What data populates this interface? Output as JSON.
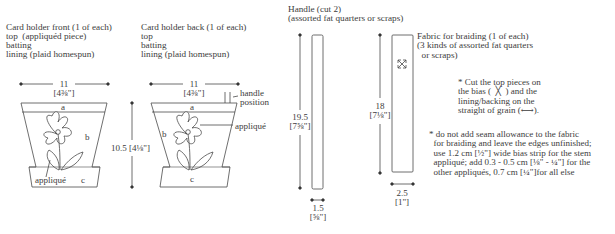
{
  "front": {
    "title": "Card holder front (1 of each)",
    "lines": [
      "top  (appliquéd piece)",
      "batting",
      "lining (plaid homespun)"
    ],
    "width_cm": "11",
    "width_in": "[4⅜\"]",
    "height_label": "10.5 [4⅛\"]",
    "section_a": "a",
    "section_b": "b",
    "section_c": "c",
    "applique_label": "appliqué"
  },
  "back": {
    "title": "Card holder back (1 of each)",
    "lines": [
      "top",
      "batting",
      "lining (plaid homespun)"
    ],
    "width_cm": "11",
    "width_in": "[4⅜\"]",
    "section_a": "a",
    "section_b": "b",
    "section_c": "c",
    "handle_position_label": "handle\nposition",
    "applique_label": "appliqué"
  },
  "handle": {
    "title": "Handle (cut 2)",
    "subtitle": "(assorted fat quarters or scraps)",
    "length_cm": "19.5",
    "length_in": "[7⅝\"]",
    "width_cm": "1.5",
    "width_in": "[⅝\"]"
  },
  "braiding": {
    "title": "Fabric for braiding (1 of each)",
    "subtitle": "(3 kinds of assorted fat quarters\n  or scraps)",
    "length_cm": "18",
    "length_in": "[7⅛\"]",
    "width_cm": "2.5",
    "width_in": "[1\"]"
  },
  "notes": {
    "bias_note": "* Cut the top pieces on\nthe bias (  ╳  ) and the\nlining/backing on the\nstraight of grain (⟷).",
    "seam_note": "* do not add seam allowance to the fabric\n  for braiding and leave the edges unfinished;\n  use 1.2 cm [½\"] wide bias strip for the stem\n  appliqué; add 0.3 - 0.5 cm [⅛\" - ¼\"] for the\n  other appliqués, 0.7 cm [¼\"]for all else"
  },
  "colors": {
    "line": "#4a4a4a",
    "text": "#3c3c3c",
    "background": "#ffffff"
  }
}
